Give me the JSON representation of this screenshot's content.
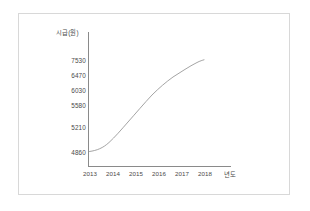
{
  "figure": {
    "background_color": "#ffffff",
    "border_color": "#d8d8d8",
    "axis_color": "#8a8a8a",
    "line_color": "#9a9a9a",
    "text_color": "#4a4a4a"
  },
  "chart_data": {
    "type": "line",
    "title": "",
    "subtitle": "",
    "xlabel": "년도",
    "ylabel": "시급(원)",
    "grid": false,
    "legend": null,
    "x": [
      2013,
      2014,
      2015,
      2016,
      2017,
      2018
    ],
    "xtick_labels": [
      "2013",
      "2014",
      "2015",
      "2016",
      "2017",
      "2018"
    ],
    "values": [
      4860,
      5210,
      5580,
      6030,
      6470,
      7530
    ],
    "ytick_labels": [
      "7530",
      "6470",
      "6030",
      "5580",
      "5210",
      "4860"
    ],
    "ytick_values": [
      7530,
      6470,
      6030,
      5580,
      5210,
      4860
    ],
    "series": [
      {
        "name": "시급(원)",
        "values": [
          4860,
          5210,
          5580,
          6030,
          6470,
          7530
        ]
      }
    ],
    "xlim": [
      2013,
      2018
    ],
    "ylim": [
      4860,
      7530
    ],
    "annotations": []
  },
  "axes": {
    "y_title": "시급(원)",
    "x_title": "년도",
    "y_ticks": [
      {
        "label": "7530",
        "y": 57
      },
      {
        "label": "6470",
        "y": 72
      },
      {
        "label": "6030",
        "y": 87
      },
      {
        "label": "5580",
        "y": 102
      },
      {
        "label": "5210",
        "y": 124
      },
      {
        "label": "4860",
        "y": 149
      }
    ],
    "x_ticks": [
      {
        "label": "2013",
        "x": 90
      },
      {
        "label": "2014",
        "x": 113
      },
      {
        "label": "2015",
        "x": 136
      },
      {
        "label": "2016",
        "x": 159
      },
      {
        "label": "2017",
        "x": 182
      },
      {
        "label": "2018",
        "x": 205
      }
    ],
    "x_title_pos": 230
  },
  "curve": {
    "path": "M 89.5,151.5 C 97,150.5 103,148 109,142.5 C 115,137 121,130 128,122 C 136,113 144,103.5 152,95 C 159,88 166,82 173,77 C 181,72 189,66.5 197,62.5 C 200,61 202.5,60.2 204,59.8"
  }
}
